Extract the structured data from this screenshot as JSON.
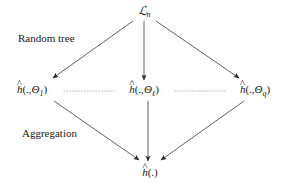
{
  "diagram": {
    "title_node": {
      "id": "dataset-node",
      "label": "ℒ",
      "subscript": "n",
      "full_text": "ℒn",
      "x": 144,
      "y": 12
    },
    "annotations": [
      {
        "id": "random-tree-label",
        "text": "Random tree",
        "x": 18,
        "y": 33
      },
      {
        "id": "aggregation-label",
        "text": "Aggregation",
        "x": 22,
        "y": 128
      }
    ],
    "tree_nodes": [
      {
        "id": "tree-node-first",
        "base": "h",
        "args": "(.,",
        "param": "Θ",
        "sub": "1",
        "close": ")",
        "full_text": "ĥ(.,Θ1)",
        "x": 32,
        "y": 91
      },
      {
        "id": "tree-node-ell",
        "base": "h",
        "args": "(.,",
        "param": "Θ",
        "sub": "ℓ",
        "close": ")",
        "full_text": "ĥ(.,Θℓ)",
        "x": 144,
        "y": 91
      },
      {
        "id": "tree-node-last",
        "base": "h",
        "args": "(.,",
        "param": "Θ",
        "sub": "q",
        "close": ")",
        "full_text": "ĥ(.,Θq)",
        "x": 255,
        "y": 91
      }
    ],
    "output_node": {
      "id": "aggregate-node",
      "base": "h",
      "args": "(.)",
      "full_text": "ĥ(.)",
      "x": 150,
      "y": 172
    },
    "edges": [
      {
        "id": "edge-dataset-to-first",
        "kind": "arrow",
        "x1": 133,
        "y1": 21,
        "x2": 53,
        "y2": 78
      },
      {
        "id": "edge-dataset-to-ell",
        "kind": "arrow",
        "x1": 144,
        "y1": 21,
        "x2": 144,
        "y2": 80
      },
      {
        "id": "edge-dataset-to-last",
        "kind": "arrow",
        "x1": 156,
        "y1": 21,
        "x2": 239,
        "y2": 78
      },
      {
        "id": "edge-first-to-output",
        "kind": "arrow",
        "x1": 54,
        "y1": 101,
        "x2": 139,
        "y2": 160
      },
      {
        "id": "edge-ell-to-output",
        "kind": "arrow",
        "x1": 148,
        "y1": 101,
        "x2": 148,
        "y2": 161
      },
      {
        "id": "edge-last-to-output",
        "kind": "arrow",
        "x1": 244,
        "y1": 101,
        "x2": 161,
        "y2": 160
      }
    ],
    "dotted_connectors": [
      {
        "id": "dots-first-to-ell",
        "x1": 64,
        "y1": 91,
        "x2": 116,
        "y2": 91
      },
      {
        "id": "dots-ell-to-last",
        "x1": 175,
        "y1": 91,
        "x2": 227,
        "y2": 91
      }
    ],
    "colors": {
      "background": "#ffffff",
      "ink": "#1a1a1a",
      "edge": "#3a3a3a",
      "dotted": "#9a9a9a"
    }
  }
}
